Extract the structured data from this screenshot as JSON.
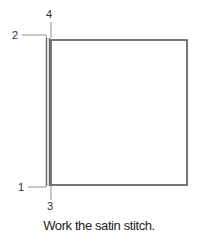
{
  "diagram": {
    "labels": {
      "point_1": "1",
      "point_2": "2",
      "point_3": "3",
      "point_4": "4"
    },
    "caption": "Work the satin stitch.",
    "colors": {
      "stroke": "#555555",
      "text": "#222222",
      "background": "#ffffff"
    }
  }
}
